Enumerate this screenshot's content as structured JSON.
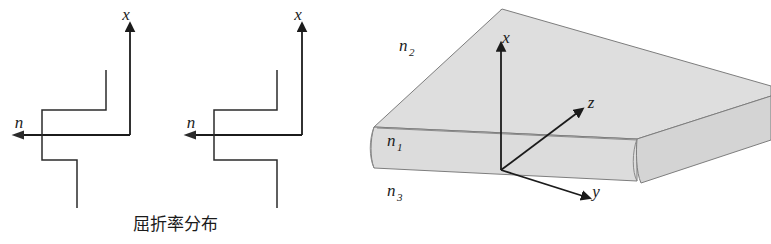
{
  "figure": {
    "background_color": "#ffffff",
    "width": 771,
    "height": 244
  },
  "caption": {
    "text": "屈折率分布",
    "meaning": "refractive index distribution"
  },
  "profiles": [
    {
      "id": "profile-left",
      "axis_x_label": "x",
      "axis_n_label": "n",
      "description": "step-index profile, three-level staircase"
    },
    {
      "id": "profile-right",
      "axis_x_label": "x",
      "axis_n_label": "n",
      "description": "step-index profile, three-level staircase"
    }
  ],
  "waveguide": {
    "layers": [
      {
        "id": "cladding",
        "label": "n",
        "subscript": "2",
        "region": "above-core"
      },
      {
        "id": "core",
        "label": "n",
        "subscript": "1",
        "region": "guiding-layer"
      },
      {
        "id": "substrate",
        "label": "n",
        "subscript": "3",
        "region": "below-core"
      }
    ],
    "axes": [
      {
        "id": "axis-x",
        "label": "x",
        "direction": "up"
      },
      {
        "id": "axis-y",
        "label": "y",
        "direction": "right-down"
      },
      {
        "id": "axis-z",
        "label": "z",
        "direction": "right-up"
      }
    ],
    "colors": {
      "top_face": "#dedede",
      "front_face": "#dcdcdc",
      "side_face": "#d4d4d4",
      "edge": "#7d7d7d",
      "ink": "#1b1b1b"
    }
  }
}
